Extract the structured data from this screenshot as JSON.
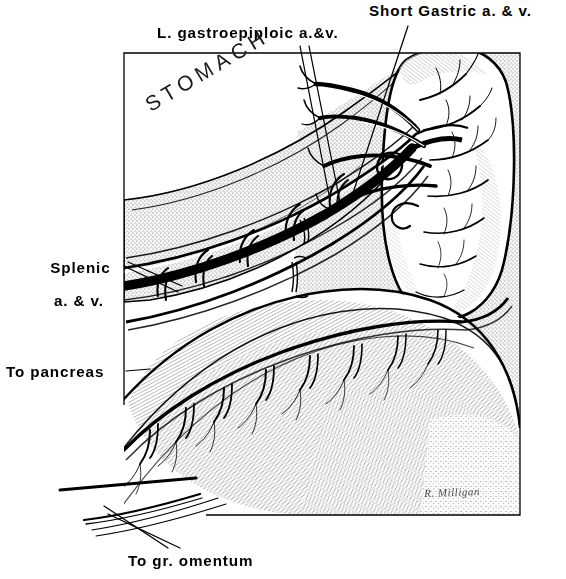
{
  "figure": {
    "medium": "black-and-white line and stipple anatomical drawing",
    "frame": {
      "x": 124,
      "y": 53,
      "width": 396,
      "height": 462
    }
  },
  "labels": {
    "short_gastric": "Short Gastric a. & v.",
    "gastroepiploic": "L. gastroepiploic a.&v.",
    "splenic_line1": "Splenic",
    "splenic_line2": "a. & v.",
    "to_pancreas": "To pancreas",
    "to_omentum": "To gr. omentum",
    "stomach": "STOMACH"
  },
  "signature": {
    "artist": "R. Milligan"
  },
  "structures": [
    {
      "name": "spleen",
      "description": "ovoid organ, upper right, hilar vessel branches"
    },
    {
      "name": "stomach",
      "description": "stippled greater curvature band, upper left to center"
    },
    {
      "name": "greater-omentum",
      "description": "fine-hatched apron, lower half"
    },
    {
      "name": "splenic-artery-and-vein",
      "description": "thick black vessel pair running left to spleen"
    },
    {
      "name": "left-gastroepiploic-vessels",
      "description": "vessel arcade along greater curvature"
    },
    {
      "name": "short-gastric-vessels",
      "description": "vessels from splenic hilum to stomach fundus"
    }
  ],
  "colors": {
    "ink": "#000000",
    "paper": "#ffffff",
    "stipple": "#6d6d6d"
  }
}
